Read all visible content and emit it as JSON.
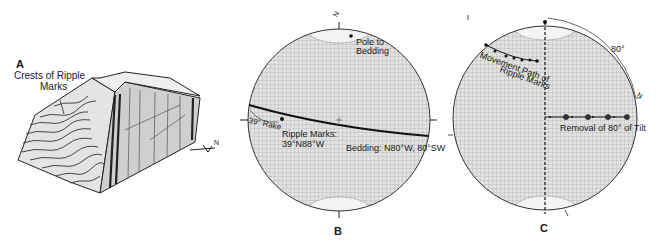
{
  "panel_a": {
    "letter": "A",
    "label_line1": "Crests of Ripple",
    "label_line2": "Marks",
    "north_arrow": "N"
  },
  "panel_b": {
    "letter": "B",
    "north_label": "N",
    "pole_label_line1": "Pole to",
    "pole_label_line2": "Bedding",
    "rake_label": "39° Rake",
    "ripple_label_line1": "Ripple Marks:",
    "ripple_label_line2": "39°N88°W",
    "bedding_label": "Bedding: N80°W, 80°SW"
  },
  "panel_c": {
    "letter": "C",
    "angle_label": "80°",
    "north_label": "N",
    "movement_label_line1": "Movement Path of",
    "movement_label_line2": "Ripple Marks",
    "removal_label": "Removal of 80° of Tilt"
  },
  "colors": {
    "ink": "#1a1a1a",
    "grid": "#8a8a8a",
    "net_fill": "#d6d6d6",
    "background": "#ffffff"
  }
}
